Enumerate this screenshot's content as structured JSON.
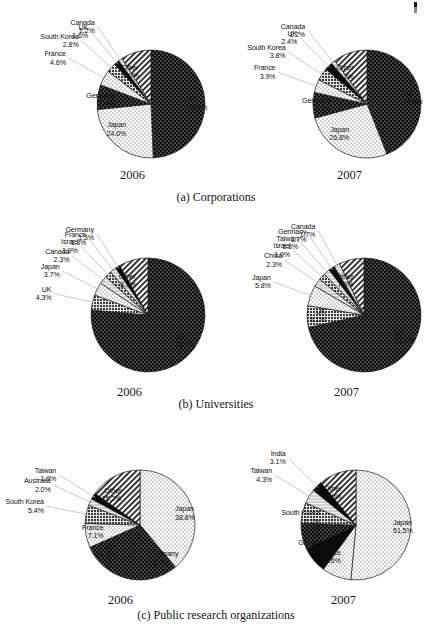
{
  "figure": {
    "rows": [
      {
        "caption": "(a) Corporations",
        "panels": [
          {
            "year": "2006",
            "chart_data": {
              "type": "pie",
              "title": "Corporations 2006",
              "categories": [
                "US",
                "Japan",
                "Germany",
                "France",
                "South Korea",
                "UK",
                "Canada",
                "Other"
              ],
              "values": [
                49.3,
                24.0,
                7.4,
                4.6,
                2.8,
                1.6,
                1.2,
                9.0
              ],
              "labels": [
                "US\n49.3%",
                "Japan\n24.0%",
                "Germany\n7.4%",
                "France\n4.6%",
                "South Korea\n2.8%",
                "UK\n1.6%",
                "Canada\n1.2%",
                "Other\n9.0%"
              ],
              "legend": "none",
              "grid": false
            },
            "slices": [
              {
                "name": "US",
                "value": 49.3,
                "pct": "49.3%",
                "pattern": "dot-on-black"
              },
              {
                "name": "Japan",
                "value": 24.0,
                "pct": "24.0%",
                "pattern": "fine-dot-white"
              },
              {
                "name": "Germany",
                "value": 7.4,
                "pct": "7.4%",
                "pattern": "dot-on-black"
              },
              {
                "name": "France",
                "value": 4.6,
                "pct": "4.6%",
                "pattern": "fine-dot-white"
              },
              {
                "name": "South Korea",
                "value": 2.8,
                "pct": "2.8%",
                "pattern": "dark-grid"
              },
              {
                "name": "UK",
                "value": 1.6,
                "pct": "1.6%",
                "pattern": "solid-black"
              },
              {
                "name": "Canada",
                "value": 1.2,
                "pct": "1.2%",
                "pattern": "light-grey"
              },
              {
                "name": "Other",
                "value": 9.0,
                "pct": "9.0%",
                "pattern": "diag-hatch"
              }
            ]
          },
          {
            "year": "2007",
            "chart_data": {
              "type": "pie",
              "title": "Corporations 2007",
              "categories": [
                "US",
                "Japan",
                "Germany",
                "France",
                "South Korea",
                "UK",
                "Canada",
                "Other"
              ],
              "values": [
                44.0,
                26.8,
                7.7,
                3.9,
                3.8,
                2.4,
                1.2,
                10.2
              ],
              "labels": [
                "US\n44.0%",
                "Japan\n26.8%",
                "Germany\n7.7%",
                "France\n3.9%",
                "South Korea\n3.8%",
                "UK\n2.4%",
                "Canada\n1.2%",
                "Other\n10.2%"
              ],
              "legend": "none",
              "grid": false
            },
            "slices": [
              {
                "name": "US",
                "value": 44.0,
                "pct": "44.0%",
                "pattern": "dot-on-black"
              },
              {
                "name": "Japan",
                "value": 26.8,
                "pct": "26.8%",
                "pattern": "fine-dot-white"
              },
              {
                "name": "Germany",
                "value": 7.7,
                "pct": "7.7%",
                "pattern": "dot-on-black"
              },
              {
                "name": "France",
                "value": 3.9,
                "pct": "3.9%",
                "pattern": "fine-dot-white"
              },
              {
                "name": "South Korea",
                "value": 3.8,
                "pct": "3.8%",
                "pattern": "dark-grid"
              },
              {
                "name": "UK",
                "value": 2.4,
                "pct": "2.4%",
                "pattern": "solid-black"
              },
              {
                "name": "Canada",
                "value": 1.2,
                "pct": "1.2%",
                "pattern": "light-grey"
              },
              {
                "name": "Other",
                "value": 10.2,
                "pct": "10.2%",
                "pattern": "diag-hatch"
              }
            ]
          }
        ]
      },
      {
        "caption": "(b) Universities",
        "panels": [
          {
            "year": "2006",
            "chart_data": {
              "type": "pie",
              "title": "Universities 2006",
              "categories": [
                "US",
                "UK",
                "Japan",
                "Canada",
                "Israel",
                "France",
                "Germany",
                "Other"
              ],
              "values": [
                76.5,
                4.3,
                3.7,
                2.3,
                1.9,
                1.8,
                1.3,
                8.3
              ],
              "labels": [
                "US\n76.5%",
                "UK\n4.3%",
                "Japan\n3.7%",
                "Canada\n2.3%",
                "Israel\n1.9%",
                "France\n1.8%",
                "Germany\n1.3%",
                "Other\n8.3%"
              ],
              "legend": "none",
              "grid": false
            },
            "slices": [
              {
                "name": "US",
                "value": 76.5,
                "pct": "76.5%",
                "pattern": "dot-on-black"
              },
              {
                "name": "UK",
                "value": 4.3,
                "pct": "4.3%",
                "pattern": "dark-grid"
              },
              {
                "name": "Japan",
                "value": 3.7,
                "pct": "3.7%",
                "pattern": "fine-dot-white"
              },
              {
                "name": "Canada",
                "value": 2.3,
                "pct": "2.3%",
                "pattern": "light-grey"
              },
              {
                "name": "Israel",
                "value": 1.9,
                "pct": "1.9%",
                "pattern": "dark-grid"
              },
              {
                "name": "France",
                "value": 1.8,
                "pct": "1.8%",
                "pattern": "light-grey"
              },
              {
                "name": "Germany",
                "value": 1.3,
                "pct": "1.3%",
                "pattern": "solid-black"
              },
              {
                "name": "Other",
                "value": 8.3,
                "pct": "8.3%",
                "pattern": "diag-hatch"
              }
            ]
          },
          {
            "year": "2007",
            "chart_data": {
              "type": "pie",
              "title": "Universities 2007",
              "categories": [
                "US",
                "UK",
                "Japan",
                "China",
                "Israel",
                "Taiwan",
                "Canada",
                "Germany",
                "Other"
              ],
              "values": [
                71.0,
                6.1,
                5.8,
                2.3,
                1.9,
                1.8,
                1.7,
                1.7,
                7.0
              ],
              "labels": [
                "US\n71.0%",
                "UK\n6.1%",
                "Japan\n5.8%",
                "China\n2.3%",
                "Israel\n1.9%",
                "Taiwan\n1.8%",
                "Canada\n1.7%",
                "Germany\n1.7%",
                "Other\n7.0%"
              ],
              "legend": "none",
              "grid": false
            },
            "slices": [
              {
                "name": "US",
                "value": 71.0,
                "pct": "71.0%",
                "pattern": "dot-on-black"
              },
              {
                "name": "UK",
                "value": 6.1,
                "pct": "6.1%",
                "pattern": "dark-grid"
              },
              {
                "name": "Japan",
                "value": 5.8,
                "pct": "5.8%",
                "pattern": "fine-dot-white"
              },
              {
                "name": "China",
                "value": 2.3,
                "pct": "2.3%",
                "pattern": "light-grey"
              },
              {
                "name": "Israel",
                "value": 1.9,
                "pct": "1.9%",
                "pattern": "dark-grid"
              },
              {
                "name": "Taiwan",
                "value": 1.8,
                "pct": "1.8%",
                "pattern": "light-grey"
              },
              {
                "name": "Germany",
                "value": 1.7,
                "pct": "1.7%",
                "pattern": "solid-black"
              },
              {
                "name": "Canada",
                "value": 1.7,
                "pct": "1.7%",
                "pattern": "light-grey"
              },
              {
                "name": "Other",
                "value": 7.0,
                "pct": "7.0%",
                "pattern": "diag-hatch"
              }
            ]
          }
        ]
      },
      {
        "caption": "(c) Public research organizations",
        "panels": [
          {
            "year": "2006",
            "chart_data": {
              "type": "pie",
              "title": "Public research organizations 2006",
              "categories": [
                "Japan",
                "Germany",
                "US",
                "France",
                "South Korea",
                "Australia",
                "Taiwan",
                "Other"
              ],
              "values": [
                38.8,
                15.7,
                13.7,
                7.1,
                5.4,
                2.0,
                1.9,
                15.2
              ],
              "labels": [
                "Japan\n38.8%",
                "Germany\n15.7%",
                "US\n13.7%",
                "France\n7.1%",
                "South Korea\n5.4%",
                "Australia\n2.0%",
                "Taiwan\n1.9%",
                "Other\n15.2%"
              ],
              "legend": "none",
              "grid": false
            },
            "slices": [
              {
                "name": "Japan",
                "value": 38.8,
                "pct": "38.8%",
                "pattern": "fine-dot-white"
              },
              {
                "name": "Germany",
                "value": 15.7,
                "pct": "15.7%",
                "pattern": "dot-on-black"
              },
              {
                "name": "US",
                "value": 13.7,
                "pct": "13.7%",
                "pattern": "dot-on-black"
              },
              {
                "name": "France",
                "value": 7.1,
                "pct": "7.1%",
                "pattern": "fine-dot-white"
              },
              {
                "name": "South Korea",
                "value": 5.4,
                "pct": "5.4%",
                "pattern": "dark-grid"
              },
              {
                "name": "Australia",
                "value": 2.0,
                "pct": "2.0%",
                "pattern": "light-grey"
              },
              {
                "name": "Taiwan",
                "value": 1.9,
                "pct": "1.9%",
                "pattern": "solid-black"
              },
              {
                "name": "Other",
                "value": 15.2,
                "pct": "15.2%",
                "pattern": "diag-hatch"
              }
            ]
          },
          {
            "year": "2007",
            "chart_data": {
              "type": "pie",
              "title": "Public research organizations 2007",
              "categories": [
                "Japan",
                "France",
                "Germany",
                "US",
                "South Korea",
                "Taiwan",
                "India",
                "Other"
              ],
              "values": [
                51.5,
                8.6,
                7.9,
                7.5,
                6.1,
                4.3,
                3.1,
                11.0
              ],
              "labels": [
                "Japan\n51.5%",
                "France\n8.6%",
                "Germany\n7.9%",
                "US\n7.5%",
                "South Korea\n6.1%",
                "Taiwan\n4.3%",
                "India\n3.1%",
                "Other\n11.0%"
              ],
              "legend": "none",
              "grid": false
            },
            "slices": [
              {
                "name": "Japan",
                "value": 51.5,
                "pct": "51.5%",
                "pattern": "fine-dot-white"
              },
              {
                "name": "France",
                "value": 8.6,
                "pct": "8.6%",
                "pattern": "fine-dot-white"
              },
              {
                "name": "Germany",
                "value": 7.9,
                "pct": "7.9%",
                "pattern": "solid-black"
              },
              {
                "name": "US",
                "value": 7.5,
                "pct": "7.5%",
                "pattern": "dot-on-black"
              },
              {
                "name": "South Korea",
                "value": 6.1,
                "pct": "6.1%",
                "pattern": "dark-grid"
              },
              {
                "name": "Taiwan",
                "value": 4.3,
                "pct": "4.3%",
                "pattern": "light-grey"
              },
              {
                "name": "India",
                "value": 3.1,
                "pct": "3.1%",
                "pattern": "solid-black"
              },
              {
                "name": "Other",
                "value": 11.0,
                "pct": "11.0%",
                "pattern": "diag-hatch"
              }
            ]
          }
        ]
      }
    ]
  }
}
